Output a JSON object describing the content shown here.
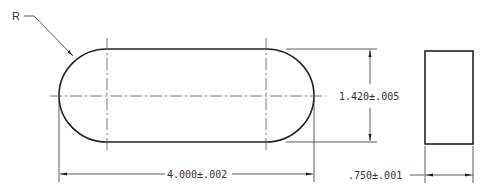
{
  "drawing": {
    "radius_label": "R",
    "length_dimension": "4.000±.002",
    "width_dimension": "1.420±.005",
    "thickness_dimension": ".750±.001"
  },
  "colors": {
    "outline": "#222222",
    "dimension": "#333333",
    "centerline": "#555555",
    "background": "#ffffff"
  }
}
